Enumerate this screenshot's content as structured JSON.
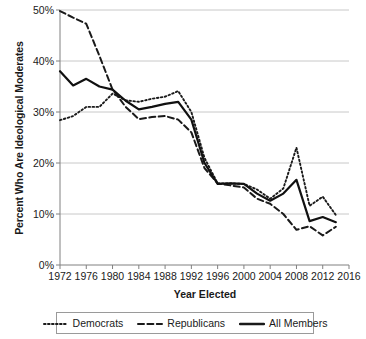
{
  "chart_data": {
    "type": "line",
    "title": "",
    "xlabel": "Year Elected",
    "ylabel": "Percent Who Are Ideological Moderates",
    "xlim": [
      1972,
      2016
    ],
    "ylim": [
      0,
      50
    ],
    "grid": true,
    "legend_position": "bottom",
    "x_tick_labels": [
      "1972",
      "1976",
      "1980",
      "1984",
      "1988",
      "1992",
      "1996",
      "2000",
      "2004",
      "2008",
      "2012",
      "2016"
    ],
    "x_ticks": [
      1972,
      1976,
      1980,
      1984,
      1988,
      1992,
      1996,
      2000,
      2004,
      2008,
      2012,
      2016
    ],
    "y_tick_labels": [
      "0%",
      "10%",
      "20%",
      "30%",
      "40%",
      "50%"
    ],
    "y_ticks": [
      0,
      10,
      20,
      30,
      40,
      50
    ],
    "x": [
      1972,
      1974,
      1976,
      1978,
      1980,
      1982,
      1984,
      1986,
      1988,
      1990,
      1992,
      1994,
      1996,
      1998,
      2000,
      2002,
      2004,
      2006,
      2008,
      2010,
      2012,
      2014
    ],
    "series": [
      {
        "name": "Democrats",
        "style": "dotted",
        "color": "#1a1a1a",
        "values": [
          28.4,
          29.2,
          31.0,
          31.0,
          33.6,
          32.3,
          32.0,
          32.6,
          33.0,
          34.1,
          30.0,
          21.0,
          16.0,
          16.0,
          15.9,
          14.8,
          13.0,
          15.0,
          23.0,
          11.6,
          13.4,
          9.8
        ]
      },
      {
        "name": "Republicans",
        "style": "dashed",
        "color": "#1a1a1a",
        "values": [
          49.8,
          48.5,
          47.3,
          41.0,
          34.4,
          31.0,
          28.6,
          29.0,
          29.2,
          28.5,
          26.0,
          19.0,
          16.0,
          15.6,
          15.2,
          13.0,
          12.0,
          10.0,
          6.9,
          7.6,
          5.8,
          7.5
        ]
      },
      {
        "name": "All Members",
        "style": "solid",
        "color": "#111111",
        "values": [
          38.0,
          35.2,
          36.5,
          35.0,
          34.4,
          32.2,
          30.5,
          31.0,
          31.6,
          32.0,
          28.5,
          20.0,
          15.9,
          16.0,
          15.9,
          14.0,
          12.6,
          14.0,
          16.7,
          8.6,
          9.4,
          8.4
        ]
      }
    ]
  },
  "legend": {
    "items": [
      {
        "label": "Democrats",
        "style": "dotted"
      },
      {
        "label": "Republicans",
        "style": "dashed"
      },
      {
        "label": "All Members",
        "style": "solid"
      }
    ]
  },
  "colors": {
    "ink": "#1a1a1a",
    "grid": "#c8c8c8",
    "axis": "#808080",
    "background": "#ffffff"
  }
}
